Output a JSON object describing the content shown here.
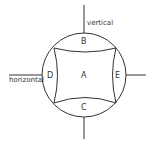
{
  "diagram": {
    "labels": {
      "vertical": "vertical",
      "horizontal": "horizontal",
      "A": "A",
      "B": "B",
      "C": "C",
      "D": "D",
      "E": "E"
    },
    "colors": {
      "stroke": "#333333",
      "background": "#ffffff"
    }
  }
}
